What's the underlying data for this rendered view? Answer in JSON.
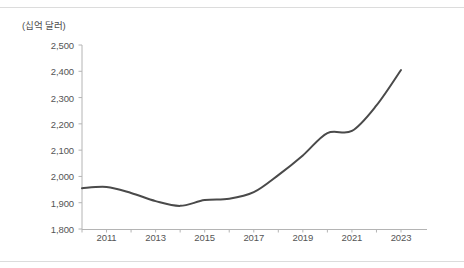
{
  "chart_data": {
    "type": "line",
    "title": "",
    "subtitle": "",
    "xlabel": "",
    "ylabel": "(십억 달러)",
    "unit_label": "(십억 달러)",
    "grid": false,
    "legend": null,
    "legend_position": "none",
    "line_color": "#4a4a4a",
    "line_width": 2,
    "smooth": true,
    "markers": false,
    "xlim": [
      2010,
      2023
    ],
    "ylim": [
      1800,
      2500
    ],
    "ytick_values": [
      2500,
      2400,
      2300,
      2200,
      2100,
      2000,
      1900,
      1800
    ],
    "ytick_labels": [
      "2,500",
      "2,400",
      "2,300",
      "2,200",
      "2,100",
      "2,000",
      "1,900",
      "1,800"
    ],
    "xtick_values": [
      2011,
      2013,
      2015,
      2017,
      2019,
      2021,
      2023
    ],
    "xtick_labels": [
      "2011",
      "2013",
      "2015",
      "2017",
      "2019",
      "2021",
      "2023"
    ],
    "x": [
      2010,
      2011,
      2012,
      2013,
      2014,
      2015,
      2016,
      2017,
      2018,
      2019,
      2020,
      2021,
      2022,
      2023
    ],
    "values": [
      1955,
      1960,
      1937,
      1906,
      1888,
      1910,
      1915,
      1940,
      2005,
      2080,
      2165,
      2173,
      2270,
      2405
    ],
    "series": [
      {
        "name": "",
        "values": [
          1955,
          1960,
          1937,
          1906,
          1888,
          1910,
          1915,
          1940,
          2005,
          2080,
          2165,
          2173,
          2270,
          2405
        ]
      }
    ]
  },
  "figure": {
    "unit_caption": "(십억 달러)",
    "axis_color": "#b4b4b4",
    "tick_text_color": "#555555",
    "background": "#ffffff",
    "divider_color": "#dcdcdc"
  }
}
